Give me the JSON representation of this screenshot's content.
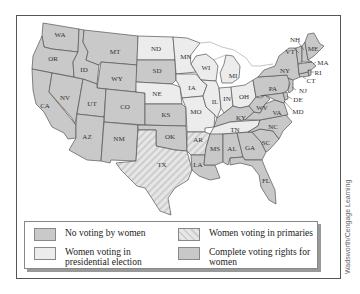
{
  "map": {
    "title": "",
    "colors": {
      "no_voting": "#c9c9c9",
      "presidential": "#ececec",
      "primaries_base": "#e4e4e4",
      "primaries_stripe": "#cfcfcf",
      "complete": "#cccccc",
      "border": "#555555",
      "water": "#ffffff"
    },
    "states": {
      "WA": {
        "label": "WA",
        "category": "no_voting"
      },
      "OR": {
        "label": "OR",
        "category": "no_voting"
      },
      "CA": {
        "label": "CA",
        "category": "no_voting"
      },
      "ID": {
        "label": "ID",
        "category": "no_voting"
      },
      "NV": {
        "label": "NV",
        "category": "no_voting"
      },
      "MT": {
        "label": "MT",
        "category": "no_voting"
      },
      "WY": {
        "label": "WY",
        "category": "no_voting"
      },
      "UT": {
        "label": "UT",
        "category": "no_voting"
      },
      "CO": {
        "label": "CO",
        "category": "no_voting"
      },
      "AZ": {
        "label": "AZ",
        "category": "no_voting"
      },
      "NM": {
        "label": "NM",
        "category": "no_voting"
      },
      "ND": {
        "label": "ND",
        "category": "presidential"
      },
      "SD": {
        "label": "SD",
        "category": "no_voting"
      },
      "NE": {
        "label": "NE",
        "category": "presidential"
      },
      "KS": {
        "label": "KS",
        "category": "no_voting"
      },
      "OK": {
        "label": "OK",
        "category": "no_voting"
      },
      "TX": {
        "label": "TX",
        "category": "primaries"
      },
      "MN": {
        "label": "MN",
        "category": "presidential"
      },
      "IA": {
        "label": "IA",
        "category": "presidential"
      },
      "MO": {
        "label": "MO",
        "category": "presidential"
      },
      "AR": {
        "label": "AR",
        "category": "primaries"
      },
      "LA": {
        "label": "LA",
        "category": "complete"
      },
      "WI": {
        "label": "WI",
        "category": "presidential"
      },
      "IL": {
        "label": "IL",
        "category": "presidential"
      },
      "MI": {
        "label": "MI",
        "category": "presidential"
      },
      "IN": {
        "label": "IN",
        "category": "presidential"
      },
      "OH": {
        "label": "OH",
        "category": "presidential"
      },
      "KY": {
        "label": "KY",
        "category": "complete"
      },
      "TN": {
        "label": "TN",
        "category": "presidential"
      },
      "MS": {
        "label": "MS",
        "category": "complete"
      },
      "AL": {
        "label": "AL",
        "category": "complete"
      },
      "GA": {
        "label": "GA",
        "category": "complete"
      },
      "FL": {
        "label": "FL",
        "category": "complete"
      },
      "SC": {
        "label": "SC",
        "category": "complete"
      },
      "NC": {
        "label": "NC",
        "category": "complete"
      },
      "VA": {
        "label": "VA",
        "category": "complete"
      },
      "WV": {
        "label": "WV",
        "category": "complete"
      },
      "PA": {
        "label": "PA",
        "category": "complete"
      },
      "NY": {
        "label": "NY",
        "category": "complete"
      },
      "VT": {
        "label": "VT",
        "category": "complete"
      },
      "NH": {
        "label": "NH",
        "category": "complete"
      },
      "ME": {
        "label": "ME",
        "category": "complete"
      },
      "MA": {
        "label": "MA",
        "category": "complete"
      },
      "RI": {
        "label": "RI",
        "category": "complete"
      },
      "CT": {
        "label": "CT",
        "category": "complete"
      },
      "NJ": {
        "label": "NJ",
        "category": "complete"
      },
      "DE": {
        "label": "DE",
        "category": "complete"
      },
      "MD": {
        "label": "MD",
        "category": "complete"
      }
    }
  },
  "legend": {
    "items": [
      {
        "label": "No voting by women",
        "category": "no_voting"
      },
      {
        "label": "Women voting in primaries",
        "category": "primaries"
      },
      {
        "label": "Women voting in presidential election",
        "category": "presidential"
      },
      {
        "label": "Complete voting rights for women",
        "category": "complete"
      }
    ]
  },
  "credit": "Wadsworth/Cengage Learning"
}
